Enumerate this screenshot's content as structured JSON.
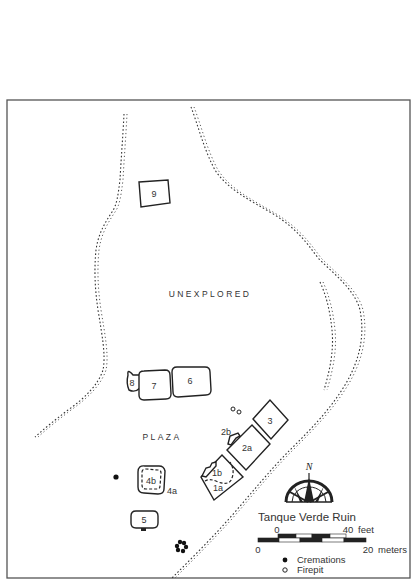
{
  "map": {
    "title": "Tanque Verde Ruin",
    "areas": {
      "unexplored": "UNEXPLORED",
      "plaza": "PLAZA"
    },
    "rooms": [
      {
        "id": "9",
        "label": "9"
      },
      {
        "id": "8",
        "label": "8"
      },
      {
        "id": "7",
        "label": "7"
      },
      {
        "id": "6",
        "label": "6"
      },
      {
        "id": "3",
        "label": "3"
      },
      {
        "id": "2a",
        "label": "2a"
      },
      {
        "id": "2b",
        "label": "2b"
      },
      {
        "id": "1a",
        "label": "1a"
      },
      {
        "id": "1b",
        "label": "1b"
      },
      {
        "id": "4a",
        "label": "4a"
      },
      {
        "id": "4b",
        "label": "4b"
      },
      {
        "id": "5",
        "label": "5"
      }
    ],
    "compass": {
      "north_label": "N",
      "icon": "compass-rose-icon"
    },
    "scale": {
      "feet_start": "0",
      "feet_end": "40",
      "feet_unit": "feet",
      "meters_start": "0",
      "meters_end": "20",
      "meters_unit": "meters"
    },
    "legend": [
      {
        "symbol": "filled-circle",
        "label": "Cremations"
      },
      {
        "symbol": "open-circle",
        "label": "Firepit"
      }
    ]
  }
}
